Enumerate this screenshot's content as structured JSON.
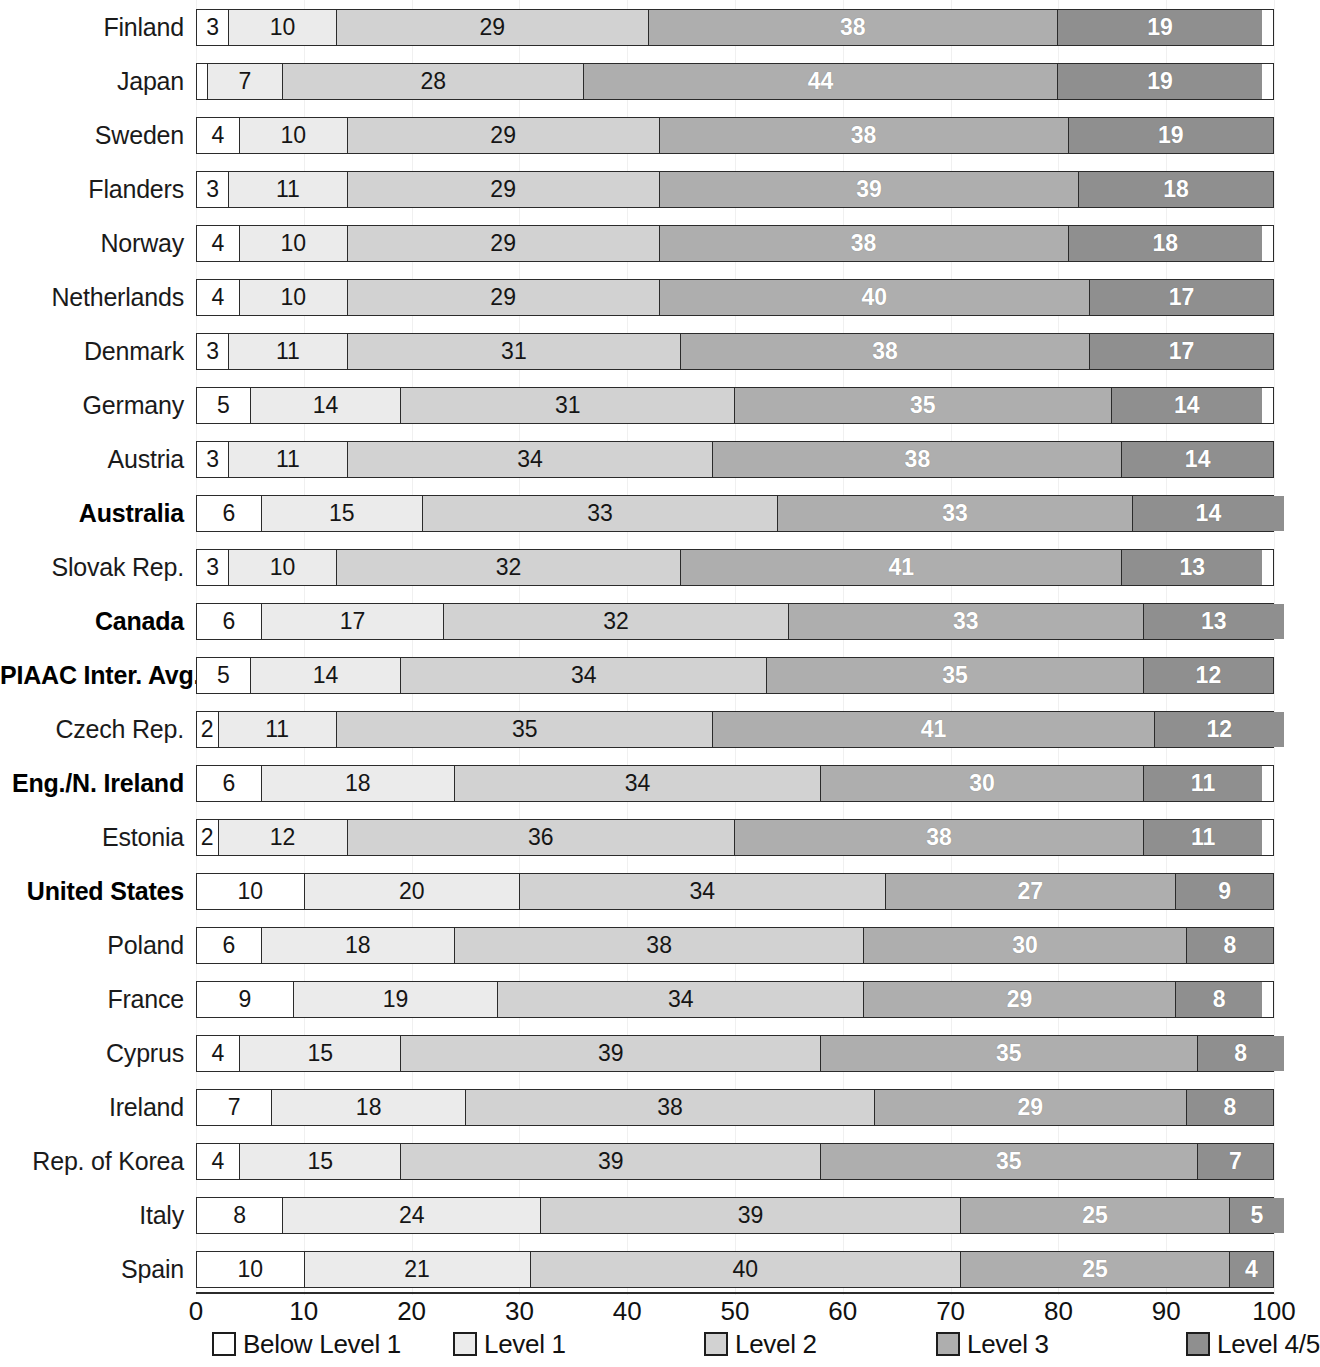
{
  "chart_data": {
    "type": "bar",
    "subtype": "stacked-horizontal-100",
    "title": "",
    "subtitle": "",
    "xlabel": "",
    "ylabel": "",
    "xlim": [
      0,
      100
    ],
    "xticks": [
      0,
      10,
      20,
      30,
      40,
      50,
      60,
      70,
      80,
      90,
      100
    ],
    "grid": true,
    "legend_position": "bottom",
    "series": [
      {
        "name": "Below Level 1",
        "color": "#ffffff",
        "values": [
          3,
          1,
          4,
          3,
          4,
          4,
          3,
          5,
          3,
          6,
          3,
          6,
          5,
          2,
          6,
          2,
          10,
          6,
          9,
          4,
          7,
          4,
          8,
          10
        ]
      },
      {
        "name": "Level 1",
        "color": "#ebebeb",
        "values": [
          10,
          7,
          10,
          11,
          10,
          10,
          11,
          14,
          11,
          15,
          10,
          17,
          14,
          11,
          18,
          12,
          20,
          18,
          19,
          15,
          18,
          15,
          24,
          21
        ]
      },
      {
        "name": "Level 2",
        "color": "#d2d2d2",
        "values": [
          29,
          28,
          29,
          29,
          29,
          29,
          31,
          31,
          34,
          33,
          32,
          32,
          34,
          35,
          34,
          36,
          34,
          38,
          34,
          39,
          38,
          39,
          39,
          40
        ]
      },
      {
        "name": "Level 3",
        "color": "#aeaeae",
        "values": [
          38,
          44,
          38,
          39,
          38,
          40,
          38,
          35,
          38,
          33,
          41,
          33,
          35,
          41,
          30,
          38,
          27,
          30,
          29,
          35,
          29,
          35,
          25,
          25
        ]
      },
      {
        "name": "Level 4/5",
        "color": "#8f8f8f",
        "values": [
          19,
          19,
          19,
          18,
          18,
          17,
          17,
          14,
          14,
          14,
          13,
          13,
          12,
          12,
          11,
          11,
          9,
          8,
          8,
          8,
          8,
          7,
          5,
          4
        ]
      }
    ],
    "categories": [
      "Finland",
      "Japan",
      "Sweden",
      "Flanders",
      "Norway",
      "Netherlands",
      "Denmark",
      "Germany",
      "Austria",
      "Australia",
      "Slovak Rep.",
      "Canada",
      "PIAAC Inter. Avg.",
      "Czech Rep.",
      "Eng./N. Ireland",
      "Estonia",
      "United States",
      "Poland",
      "France",
      "Cyprus",
      "Ireland",
      "Rep. of Korea",
      "Italy",
      "Spain"
    ],
    "highlighted_categories": [
      "Australia",
      "Canada",
      "PIAAC Inter. Avg.",
      "Eng./N. Ireland",
      "United States"
    ]
  },
  "rows": [
    {
      "label": "Finland",
      "bold": false,
      "values": [
        3,
        10,
        29,
        38,
        19
      ]
    },
    {
      "label": "Japan",
      "bold": false,
      "values": [
        1,
        7,
        28,
        44,
        19
      ]
    },
    {
      "label": "Sweden",
      "bold": false,
      "values": [
        4,
        10,
        29,
        38,
        19
      ]
    },
    {
      "label": "Flanders",
      "bold": false,
      "values": [
        3,
        11,
        29,
        39,
        18
      ]
    },
    {
      "label": "Norway",
      "bold": false,
      "values": [
        4,
        10,
        29,
        38,
        18
      ]
    },
    {
      "label": "Netherlands",
      "bold": false,
      "values": [
        4,
        10,
        29,
        40,
        17
      ]
    },
    {
      "label": "Denmark",
      "bold": false,
      "values": [
        3,
        11,
        31,
        38,
        17
      ]
    },
    {
      "label": "Germany",
      "bold": false,
      "values": [
        5,
        14,
        31,
        35,
        14
      ]
    },
    {
      "label": "Austria",
      "bold": false,
      "values": [
        3,
        11,
        34,
        38,
        14
      ]
    },
    {
      "label": "Australia",
      "bold": true,
      "values": [
        6,
        15,
        33,
        33,
        14
      ]
    },
    {
      "label": "Slovak Rep.",
      "bold": false,
      "values": [
        3,
        10,
        32,
        41,
        13
      ]
    },
    {
      "label": "Canada",
      "bold": true,
      "values": [
        6,
        17,
        32,
        33,
        13
      ]
    },
    {
      "label": "PIAAC Inter. Avg.",
      "bold": true,
      "values": [
        5,
        14,
        34,
        35,
        12
      ]
    },
    {
      "label": "Czech Rep.",
      "bold": false,
      "values": [
        2,
        11,
        35,
        41,
        12
      ]
    },
    {
      "label": "Eng./N. Ireland",
      "bold": true,
      "values": [
        6,
        18,
        34,
        30,
        11
      ]
    },
    {
      "label": "Estonia",
      "bold": false,
      "values": [
        2,
        12,
        36,
        38,
        11
      ]
    },
    {
      "label": "United States",
      "bold": true,
      "values": [
        10,
        20,
        34,
        27,
        9
      ]
    },
    {
      "label": "Poland",
      "bold": false,
      "values": [
        6,
        18,
        38,
        30,
        8
      ]
    },
    {
      "label": "France",
      "bold": false,
      "values": [
        9,
        19,
        34,
        29,
        8
      ]
    },
    {
      "label": "Cyprus",
      "bold": false,
      "values": [
        4,
        15,
        39,
        35,
        8
      ]
    },
    {
      "label": "Ireland",
      "bold": false,
      "values": [
        7,
        18,
        38,
        29,
        8
      ]
    },
    {
      "label": "Rep. of Korea",
      "bold": false,
      "values": [
        4,
        15,
        39,
        35,
        7
      ]
    },
    {
      "label": "Italy",
      "bold": false,
      "values": [
        8,
        24,
        39,
        25,
        5
      ]
    },
    {
      "label": "Spain",
      "bold": false,
      "values": [
        10,
        21,
        40,
        25,
        4
      ]
    }
  ],
  "axis": {
    "ticks": [
      "0",
      "10",
      "20",
      "30",
      "40",
      "50",
      "60",
      "70",
      "80",
      "90",
      "100"
    ]
  },
  "legend": {
    "items": [
      {
        "label": "Below Level 1",
        "color": "#ffffff"
      },
      {
        "label": "Level 1",
        "color": "#ebebeb"
      },
      {
        "label": "Level 2",
        "color": "#d2d2d2"
      },
      {
        "label": "Level 3",
        "color": "#aeaeae"
      },
      {
        "label": "Level 4/5",
        "color": "#8f8f8f"
      }
    ]
  }
}
